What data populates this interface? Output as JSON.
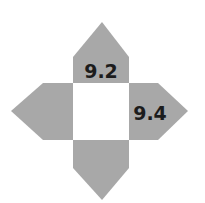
{
  "diagram": {
    "fill_color": "#a8a8a8",
    "center_color": "#ffffff",
    "arrows": {
      "top": {
        "label": "9.2"
      },
      "right": {
        "label": "9.4"
      },
      "bottom": {
        "label": ""
      },
      "left": {
        "label": ""
      }
    }
  }
}
